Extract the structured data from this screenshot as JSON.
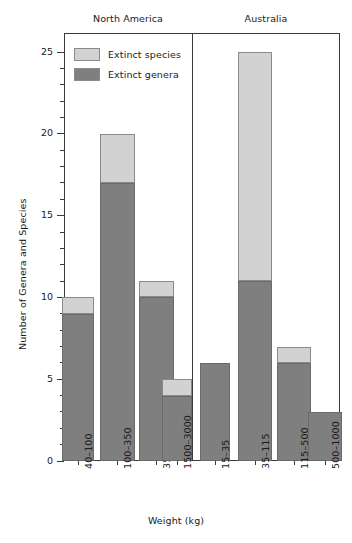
{
  "chart_data": {
    "type": "bar",
    "subtype": "stacked-bar-grouped-panels",
    "title": "",
    "xlabel": "Weight (kg)",
    "ylabel": "Number of Genera and Species",
    "ylim": [
      0,
      26
    ],
    "y_major_ticks": [
      0,
      5,
      10,
      15,
      20,
      25
    ],
    "y_minor_tick_step": 1,
    "grid": false,
    "legend_position": "top-left inside plot",
    "legend": [
      {
        "key": "species",
        "label": "Extinct species",
        "color": "#d2d2d2"
      },
      {
        "key": "genera",
        "label": "Extinct genera",
        "color": "#7f7f7f"
      }
    ],
    "panels": [
      {
        "key": "north-america",
        "label": "North America"
      },
      {
        "key": "australia",
        "label": "Australia"
      }
    ],
    "categories": [
      "40–100",
      "100–350",
      "350–1500",
      "1500–3000",
      "15–35",
      "35–115",
      "115–500",
      "500–1000"
    ],
    "series": [
      {
        "name": "Extinct genera",
        "values": [
          9,
          17,
          10,
          4,
          6,
          11,
          6,
          3
        ]
      },
      {
        "name": "Extinct species",
        "values": [
          10,
          20,
          11,
          5,
          6,
          25,
          7,
          3
        ]
      }
    ],
    "bars": [
      {
        "panel": "north-america",
        "category": "40–100",
        "genera": 9,
        "species_total": 10
      },
      {
        "panel": "north-america",
        "category": "100–350",
        "genera": 17,
        "species_total": 20
      },
      {
        "panel": "north-america",
        "category": "350–1500",
        "genera": 10,
        "species_total": 11
      },
      {
        "panel": "north-america",
        "category": "1500–3000",
        "genera": 4,
        "species_total": 5
      },
      {
        "panel": "australia",
        "category": "15–35",
        "genera": 6,
        "species_total": 6
      },
      {
        "panel": "australia",
        "category": "35–115",
        "genera": 11,
        "species_total": 25
      },
      {
        "panel": "australia",
        "category": "115–500",
        "genera": 6,
        "species_total": 7
      },
      {
        "panel": "australia",
        "category": "500–1000",
        "genera": 3,
        "species_total": 3
      }
    ]
  },
  "axis": {
    "y_tick_labels": [
      "0",
      "5",
      "10",
      "15",
      "20",
      "25"
    ]
  },
  "colors": {
    "species": "#d2d2d2",
    "genera": "#7f7f7f",
    "axis": "#3a3a3a",
    "bar_outline": "#8a8a8a",
    "background": "#ffffff"
  }
}
